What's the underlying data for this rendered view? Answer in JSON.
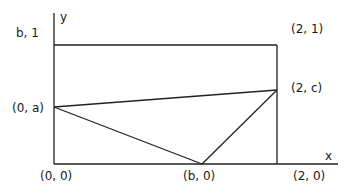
{
  "diagram": {
    "axes": {
      "x_label": "x",
      "y_label": "y"
    },
    "points": {
      "origin": "(0, 0)",
      "b_zero": "(b, 0)",
      "two_zero": "(2, 0)",
      "zero_a": "(0, a)",
      "two_c": "(2, c)",
      "two_one": "(2, 1)",
      "b_one": "b, 1"
    },
    "colors": {
      "line": "#222222",
      "text": "#1a1a1a",
      "background": "#ffffff"
    }
  }
}
